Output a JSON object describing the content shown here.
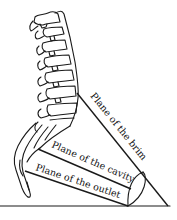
{
  "diagram": {
    "labels": {
      "brim": "Plane of the brim",
      "cavity": "Plane of the cavity",
      "outlet": "Plane of the outlet"
    },
    "colors": {
      "line": "#1a1a1a",
      "background": "#ffffff"
    }
  }
}
